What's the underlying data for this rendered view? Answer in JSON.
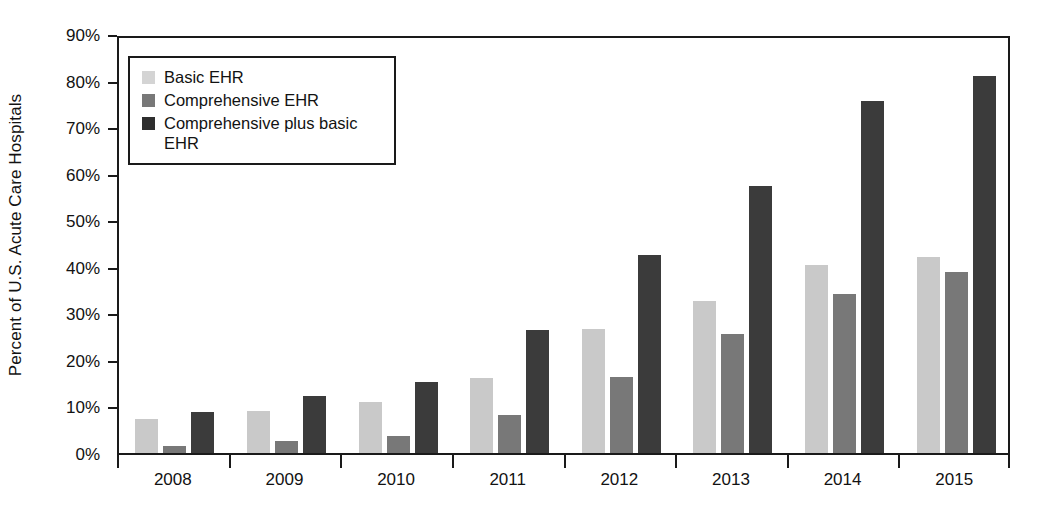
{
  "chart_data": {
    "type": "bar",
    "title": "",
    "subtitle": "",
    "xlabel": "",
    "ylabel": "Percent of U.S. Acute Care Hospitals",
    "categories": [
      "2008",
      "2009",
      "2010",
      "2011",
      "2012",
      "2013",
      "2014",
      "2015"
    ],
    "series": [
      {
        "name": "Basic EHR",
        "color": "#c9c9c9",
        "values": [
          7.2,
          9.1,
          11.0,
          16.1,
          26.6,
          32.7,
          40.4,
          42.0
        ]
      },
      {
        "name": "Comprehensive EHR",
        "color": "#787878",
        "values": [
          1.5,
          2.5,
          3.6,
          8.2,
          16.4,
          25.5,
          34.1,
          38.8
        ]
      },
      {
        "name": "Comprehensive plus basic EHR",
        "color": "#3b3b3b",
        "values": [
          8.9,
          12.2,
          15.2,
          26.4,
          42.5,
          57.3,
          75.6,
          80.9
        ]
      }
    ],
    "ylim": [
      0,
      90
    ],
    "yticks": [
      0,
      10,
      20,
      30,
      40,
      50,
      60,
      70,
      80,
      90
    ],
    "ytick_labels": [
      "0%",
      "10%",
      "20%",
      "30%",
      "40%",
      "50%",
      "60%",
      "70%",
      "80%",
      "90%"
    ],
    "grid": false,
    "legend_position": "upper-left-inside",
    "legend_entries": [
      {
        "label": "Basic EHR",
        "color": "#d4d4d4"
      },
      {
        "label": "Comprehensive EHR",
        "color": "#787878"
      },
      {
        "label": "Comprehensive plus basic EHR",
        "color": "#2e2e2e"
      }
    ]
  }
}
